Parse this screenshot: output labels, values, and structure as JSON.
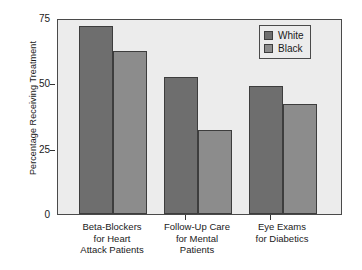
{
  "chart_data": {
    "type": "bar",
    "title": "",
    "subtitle": "",
    "xlabel": "",
    "ylabel": "Percentage Receiving Treatment",
    "ylim": [
      0,
      75
    ],
    "yticks": [
      0,
      25,
      50,
      75
    ],
    "ytick_labels": [
      "0",
      "25",
      "50",
      "75"
    ],
    "grid": false,
    "legend_position": "top-right",
    "categories": [
      "Beta-Blockers for Heart Attack Patients",
      "Follow-Up Care for Mental Patients",
      "Eye Exams for Diabetics"
    ],
    "category_label_lines": [
      [
        "Beta-Blockers",
        "for Heart",
        "Attack Patients"
      ],
      [
        "Follow-Up Care",
        "for Mental",
        "Patients"
      ],
      [
        "Eye Exams",
        "for Diabetics"
      ]
    ],
    "series": [
      {
        "name": "White",
        "color": "#6e6e6e",
        "values": [
          72,
          52.5,
          49
        ]
      },
      {
        "name": "Black",
        "color": "#8c8c8c",
        "values": [
          62.5,
          32,
          42
        ]
      }
    ]
  },
  "legend": {
    "entries": [
      {
        "label": "White",
        "color": "#6e6e6e"
      },
      {
        "label": "Black",
        "color": "#8c8c8c"
      }
    ]
  },
  "colors": {
    "plot_background": "#ececec",
    "plot_border": "#4a4a4a",
    "page_background": "#ffffff",
    "text": "#1a1a1a",
    "bar_outline": "#3d3d3d"
  }
}
